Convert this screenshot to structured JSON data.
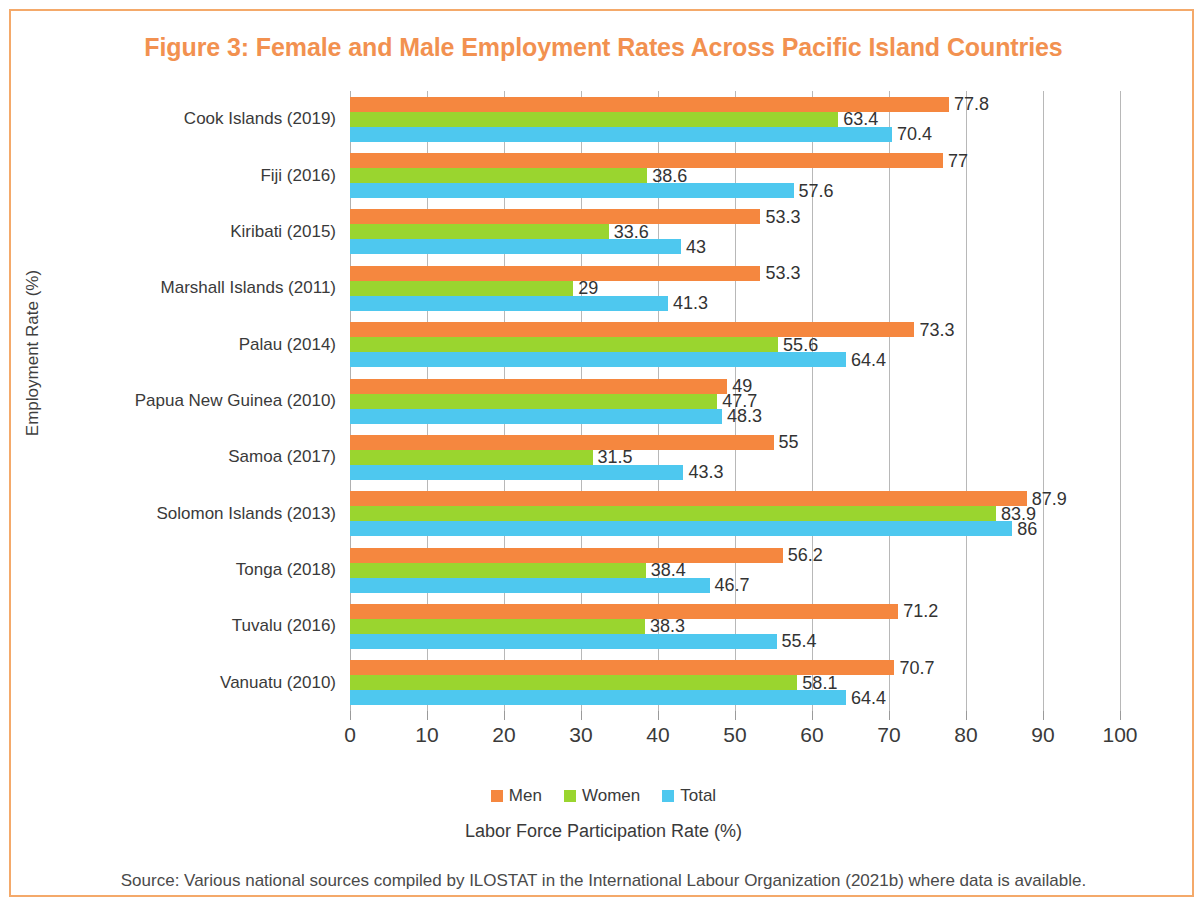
{
  "figure": {
    "title": "Figure 3: Female and Male Employment Rates Across Pacific Island Countries",
    "title_color": "#F29150",
    "border_color": "#F4A96A",
    "source": "Source: Various national sources compiled by ILOSTAT in the International Labour Organization (2021b) where data is available."
  },
  "chart_data": {
    "type": "bar",
    "orientation": "horizontal",
    "title": "Figure 3: Female and Male Employment Rates Across Pacific Island Countries",
    "xlabel": "Labor Force Participation Rate (%)",
    "ylabel": "Employment Rate (%)",
    "xlim": [
      0,
      100
    ],
    "xticks": [
      "0",
      "10",
      "20",
      "30",
      "40",
      "50",
      "60",
      "70",
      "80",
      "90",
      "100"
    ],
    "grid": "vertical",
    "legend_position": "bottom",
    "categories": [
      "Cook Islands (2019)",
      "Fiji (2016)",
      "Kiribati (2015)",
      "Marshall Islands (2011)",
      "Palau (2014)",
      "Papua New Guinea (2010)",
      "Samoa (2017)",
      "Solomon Islands (2013)",
      "Tonga (2018)",
      "Tuvalu (2016)",
      "Vanuatu (2010)"
    ],
    "series": [
      {
        "name": "Men",
        "color": "#F5873F",
        "values": [
          77.8,
          77,
          53.3,
          53.3,
          73.3,
          49,
          55,
          87.9,
          56.2,
          71.2,
          70.7
        ],
        "labels": [
          "77.8",
          "77",
          "53.3",
          "53.3",
          "73.3",
          "49",
          "55",
          "87.9",
          "56.2",
          "71.2",
          "70.7"
        ]
      },
      {
        "name": "Women",
        "color": "#9AD52F",
        "values": [
          63.4,
          38.6,
          33.6,
          29,
          55.6,
          47.7,
          31.5,
          83.9,
          38.4,
          38.3,
          58.1
        ],
        "labels": [
          "63.4",
          "38.6",
          "33.6",
          "29",
          "55.6",
          "47.7",
          "31.5",
          "83.9",
          "38.4",
          "38.3",
          "58.1"
        ]
      },
      {
        "name": "Total",
        "color": "#4EC8EF",
        "values": [
          70.4,
          57.6,
          43,
          41.3,
          64.4,
          48.3,
          43.3,
          86,
          46.7,
          55.4,
          64.4
        ],
        "labels": [
          "70.4",
          "57.6",
          "43",
          "41.3",
          "64.4",
          "48.3",
          "43.3",
          "86",
          "46.7",
          "55.4",
          "64.4"
        ]
      }
    ]
  }
}
